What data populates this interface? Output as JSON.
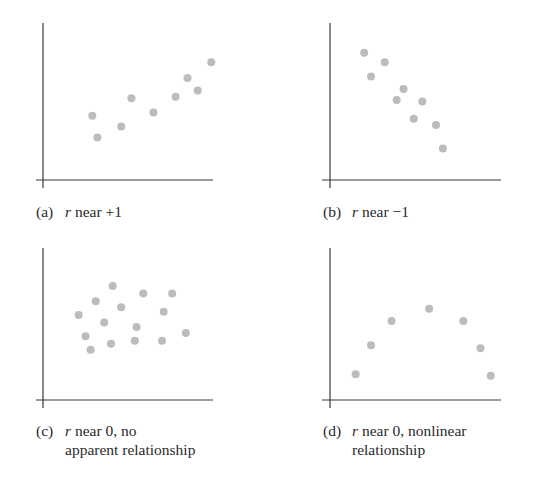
{
  "chart_data": [
    {
      "type": "scatter",
      "id": "a",
      "label": "(a)",
      "caption_lines": [
        {
          "var": "r",
          "text": " near +1"
        }
      ],
      "xlim": [
        0,
        10
      ],
      "ylim": [
        0,
        10
      ],
      "grid": false,
      "ticks": "none",
      "points": [
        [
          2.9,
          4.1
        ],
        [
          3.2,
          2.7
        ],
        [
          4.6,
          3.4
        ],
        [
          5.2,
          5.2
        ],
        [
          6.5,
          4.3
        ],
        [
          7.8,
          5.3
        ],
        [
          8.5,
          6.5
        ],
        [
          9.1,
          5.7
        ],
        [
          9.9,
          7.5
        ]
      ]
    },
    {
      "type": "scatter",
      "id": "b",
      "label": "(b)",
      "caption_lines": [
        {
          "var": "r",
          "text": " near −1"
        }
      ],
      "xlim": [
        0,
        10
      ],
      "ylim": [
        0,
        10
      ],
      "grid": false,
      "ticks": "none",
      "points": [
        [
          2.0,
          8.1
        ],
        [
          2.4,
          6.6
        ],
        [
          3.2,
          7.5
        ],
        [
          3.9,
          5.1
        ],
        [
          4.3,
          5.8
        ],
        [
          4.9,
          3.9
        ],
        [
          5.4,
          5.0
        ],
        [
          6.2,
          3.5
        ],
        [
          6.6,
          2.0
        ]
      ]
    },
    {
      "type": "scatter",
      "id": "c",
      "label": "(c)",
      "caption_lines": [
        {
          "var": "r",
          "text": " near 0, no"
        },
        {
          "var": "",
          "text": "apparent relationship"
        }
      ],
      "xlim": [
        0,
        10
      ],
      "ylim": [
        0,
        10
      ],
      "grid": false,
      "ticks": "none",
      "points": [
        [
          2.1,
          5.6
        ],
        [
          3.1,
          6.5
        ],
        [
          4.1,
          7.5
        ],
        [
          2.5,
          4.2
        ],
        [
          2.8,
          3.3
        ],
        [
          3.6,
          5.1
        ],
        [
          4.0,
          3.7
        ],
        [
          4.6,
          6.1
        ],
        [
          5.5,
          4.8
        ],
        [
          5.9,
          7.0
        ],
        [
          5.4,
          3.9
        ],
        [
          7.0,
          3.9
        ],
        [
          7.1,
          5.8
        ],
        [
          7.6,
          7.0
        ],
        [
          8.4,
          4.4
        ]
      ]
    },
    {
      "type": "scatter",
      "id": "d",
      "label": "(d)",
      "caption_lines": [
        {
          "var": "r",
          "text": " near 0, nonlinear"
        },
        {
          "var": "",
          "text": "relationship"
        }
      ],
      "xlim": [
        0,
        10
      ],
      "ylim": [
        0,
        10
      ],
      "grid": false,
      "ticks": "none",
      "points": [
        [
          1.5,
          1.7
        ],
        [
          2.4,
          3.6
        ],
        [
          3.6,
          5.2
        ],
        [
          5.8,
          6.0
        ],
        [
          7.8,
          5.2
        ],
        [
          8.8,
          3.4
        ],
        [
          9.4,
          1.6
        ]
      ]
    }
  ],
  "colors": {
    "point": "#bcbcbc",
    "axis": "#3a3a3a",
    "text": "#2a2a2a"
  }
}
